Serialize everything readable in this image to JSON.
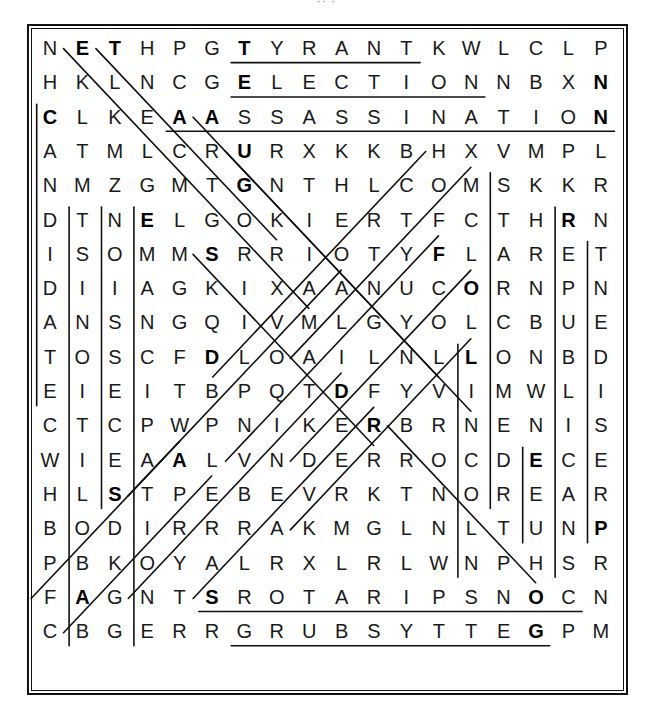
{
  "caption": "··   ·",
  "puzzle": {
    "title": "Civil War Word Search",
    "rows": 19,
    "cols": 19,
    "grid": [
      [
        "N",
        "E",
        "T",
        "H",
        "P",
        "G",
        "T",
        "Y",
        "R",
        "A",
        "N",
        "T",
        "K",
        "W",
        "L",
        "C",
        "L",
        "P",
        ""
      ],
      [
        "H",
        "K",
        "L",
        "N",
        "C",
        "G",
        "E",
        "L",
        "E",
        "C",
        "T",
        "I",
        "O",
        "N",
        "N",
        "B",
        "X",
        "N",
        ""
      ],
      [
        "C",
        "L",
        "K",
        "E",
        "A",
        "A",
        "S",
        "S",
        "A",
        "S",
        "S",
        "I",
        "N",
        "A",
        "T",
        "I",
        "O",
        "N",
        ""
      ],
      [
        "A",
        "T",
        "M",
        "L",
        "C",
        "R",
        "U",
        "R",
        "X",
        "K",
        "K",
        "B",
        "H",
        "X",
        "V",
        "M",
        "P",
        "L",
        ""
      ],
      [
        "N",
        "M",
        "Z",
        "G",
        "M",
        "T",
        "G",
        "N",
        "T",
        "H",
        "L",
        "C",
        "O",
        "M",
        "S",
        "K",
        "K",
        "R",
        ""
      ],
      [
        "D",
        "T",
        "N",
        "E",
        "L",
        "G",
        "O",
        "K",
        "I",
        "E",
        "R",
        "T",
        "F",
        "C",
        "T",
        "H",
        "R",
        "N",
        ""
      ],
      [
        "I",
        "S",
        "O",
        "M",
        "M",
        "S",
        "R",
        "R",
        "I",
        "O",
        "T",
        "Y",
        "F",
        "L",
        "A",
        "R",
        "E",
        "T",
        ""
      ],
      [
        "D",
        "I",
        "I",
        "A",
        "G",
        "K",
        "I",
        "X",
        "A",
        "A",
        "N",
        "U",
        "C",
        "O",
        "R",
        "N",
        "P",
        "N",
        ""
      ],
      [
        "A",
        "N",
        "S",
        "N",
        "G",
        "Q",
        "I",
        "V",
        "M",
        "L",
        "G",
        "Y",
        "O",
        "L",
        "C",
        "B",
        "U",
        "E",
        ""
      ],
      [
        "T",
        "O",
        "S",
        "C",
        "F",
        "D",
        "L",
        "O",
        "A",
        "I",
        "L",
        "N",
        "L",
        "L",
        "O",
        "N",
        "B",
        "D",
        ""
      ],
      [
        "E",
        "I",
        "E",
        "I",
        "T",
        "B",
        "P",
        "Q",
        "T",
        "D",
        "F",
        "Y",
        "V",
        "I",
        "M",
        "W",
        "L",
        "I",
        ""
      ],
      [
        "C",
        "T",
        "C",
        "P",
        "W",
        "P",
        "N",
        "I",
        "K",
        "E",
        "R",
        "B",
        "R",
        "N",
        "E",
        "N",
        "I",
        "S",
        ""
      ],
      [
        "W",
        "I",
        "E",
        "A",
        "A",
        "L",
        "V",
        "N",
        "D",
        "E",
        "R",
        "R",
        "O",
        "C",
        "D",
        "E",
        "C",
        "E",
        ""
      ],
      [
        "H",
        "L",
        "S",
        "T",
        "P",
        "E",
        "B",
        "E",
        "V",
        "R",
        "K",
        "T",
        "N",
        "O",
        "R",
        "E",
        "A",
        "R",
        ""
      ],
      [
        "B",
        "O",
        "D",
        "I",
        "R",
        "R",
        "R",
        "A",
        "K",
        "M",
        "G",
        "L",
        "N",
        "L",
        "T",
        "U",
        "N",
        "P",
        ""
      ],
      [
        "P",
        "B",
        "K",
        "O",
        "Y",
        "A",
        "L",
        "R",
        "X",
        "L",
        "R",
        "L",
        "W",
        "N",
        "P",
        "H",
        "S",
        "R",
        ""
      ],
      [
        "F",
        "A",
        "G",
        "N",
        "T",
        "S",
        "R",
        "O",
        "T",
        "A",
        "R",
        "I",
        "P",
        "S",
        "N",
        "O",
        "C",
        "N",
        ""
      ],
      [
        "C",
        "B",
        "G",
        "E",
        "R",
        "R",
        "G",
        "R",
        "U",
        "B",
        "S",
        "Y",
        "T",
        "T",
        "E",
        "G",
        "P",
        "M",
        ""
      ]
    ],
    "found_words": [
      "TYRANT",
      "ELECTION",
      "ASSASSINATION",
      "CANDIDATE",
      "ABOLITIONIST",
      "SECESSION",
      "EMANCIPATION",
      "LINCOLN",
      "REPUBLICANS",
      "PRESIDENT",
      "CONSPIRATORS",
      "GETTYSBURG",
      "DEMOCRATS",
      "BOOTH",
      "CONFEDERATE",
      "UNION",
      "RIOT",
      "SLAVERY",
      "FLAG",
      "REBEL"
    ]
  },
  "colors": {
    "ink": "#1a1a1a",
    "frame": "#111111",
    "ring": "#111111",
    "background": "#ffffff"
  }
}
